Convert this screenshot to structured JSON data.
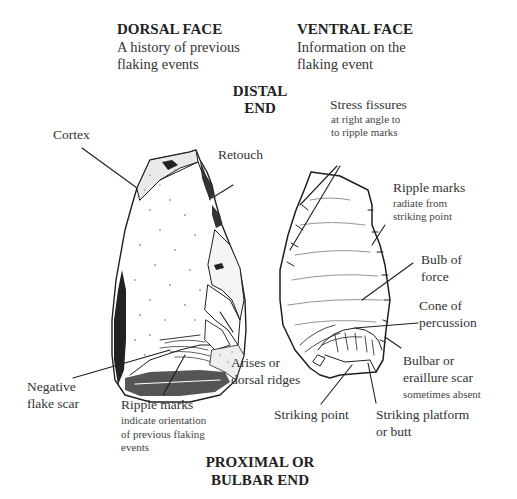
{
  "headings": {
    "dorsal_title": "DORSAL FACE",
    "dorsal_line1": "A history of previous",
    "dorsal_line2": "flaking events",
    "ventral_title": "VENTRAL FACE",
    "ventral_line1": "Information on the",
    "ventral_line2": "flaking event",
    "distal_line1": "DISTAL",
    "distal_line2": "END",
    "proximal_line1": "PROXIMAL OR",
    "proximal_line2": "BULBAR END"
  },
  "dorsal_labels": {
    "cortex": "Cortex",
    "retouch": "Retouch",
    "arises_line1": "Arises or",
    "arises_line2": "dorsal ridges",
    "negative_line1": "Negative",
    "negative_line2": "flake scar",
    "ripple_title": "Ripple marks",
    "ripple_sub1": "indicate orientation",
    "ripple_sub2": "of previous flaking",
    "ripple_sub3": "events"
  },
  "ventral_labels": {
    "stress_title": "Stress fissures",
    "stress_sub1": "at right angle to",
    "stress_sub2": "to ripple marks",
    "ripple_title": "Ripple marks",
    "ripple_sub1": "radiate from",
    "ripple_sub2": "striking point",
    "bulb_line1": "Bulb of",
    "bulb_line2": "force",
    "cone_line1": "Cone of",
    "cone_line2": "percussion",
    "bulbar_line1": "Bulbar or",
    "bulbar_line2": "eraillure scar",
    "bulbar_sub": "sometimes absent",
    "striking_point": "Striking point",
    "platform_line1": "Striking platform",
    "platform_line2": "or butt"
  },
  "colors": {
    "ink": "#222222",
    "background": "#ffffff"
  }
}
